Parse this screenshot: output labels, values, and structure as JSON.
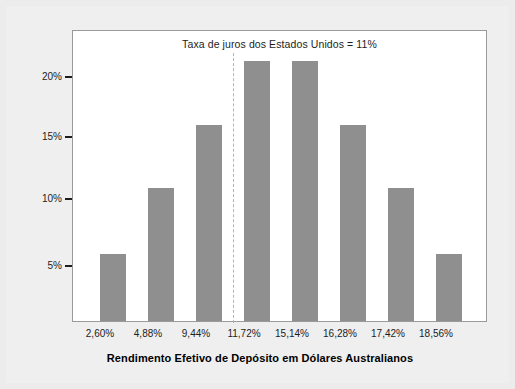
{
  "chart_data": {
    "type": "bar",
    "title": "",
    "categories": [
      "2,60%",
      "4,88%",
      "9,44%",
      "11,72%",
      "15,14%",
      "16,28%",
      "17,42%",
      "18,56%"
    ],
    "values": [
      5.2,
      10.3,
      15.2,
      20.2,
      20.2,
      15.2,
      10.3,
      5.2
    ],
    "value_labels": [
      "5%",
      "10%",
      "15%",
      "20%",
      "20%",
      "15%",
      "10%",
      "5%"
    ],
    "xlabel": "Rendimento Efetivo de Depósito em Dólares Australianos",
    "ylabel": "Probabilidade",
    "ylim": [
      0,
      22.5
    ],
    "yticks": [
      5,
      10,
      15,
      20
    ],
    "ytick_labels": [
      "5%",
      "10%",
      "15%",
      "20%"
    ],
    "grid": false,
    "legend": "none",
    "annotations": [
      {
        "text": "Taxa de juros dos Estados Unidos = 11%",
        "reference_value": "11%",
        "position": "top-center"
      }
    ],
    "reference_line": {
      "label": "Taxa de juros dos Estados Unidos = 11%",
      "value": 11,
      "style": "dashed",
      "orientation": "vertical",
      "color": "#b4b4b4"
    },
    "colors": {
      "bar": "#8f8f8f",
      "background": "#ececec",
      "panel": "#ffffff",
      "axis": "#9a9a9a",
      "text": "#1d1d1d"
    }
  }
}
